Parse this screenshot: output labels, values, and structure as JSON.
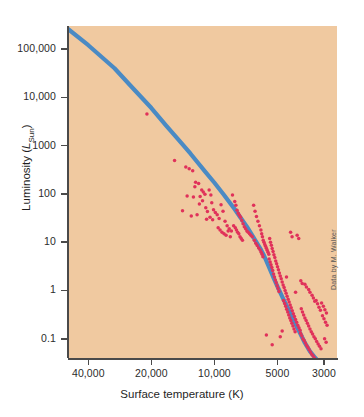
{
  "figure": {
    "credit": "Data by M. Walker",
    "background_color": "#f0c9a0",
    "page_color": "#ffffff"
  },
  "chart_data": {
    "type": "scatter",
    "title": "",
    "xlabel": "Surface temperature (K)",
    "ylabel": "Luminosity (LSun)",
    "ylabel_parts": {
      "main": "Luminosity (",
      "italic": "L",
      "subscript": "Sun",
      "close": ")"
    },
    "xscale": "log",
    "yscale": "log",
    "x_reversed": true,
    "xlim": [
      50000,
      2600
    ],
    "ylim": [
      0.04,
      300000
    ],
    "grid": false,
    "legend": null,
    "xticks": [
      40000,
      20000,
      10000,
      5000,
      3000
    ],
    "xtick_labels": [
      "40,000",
      "20,000",
      "10,000",
      "5000",
      "3000"
    ],
    "yticks": [
      100000,
      10000,
      1000,
      100,
      10,
      1,
      0.1
    ],
    "ytick_labels": [
      "100,000",
      "10,000",
      "1000",
      "100",
      "10",
      "1",
      "0.1"
    ],
    "point_color": "#e0315a",
    "line_color": "#4a8ac4",
    "line_width": 4.2,
    "series": [
      {
        "name": "main sequence",
        "type": "line",
        "points": [
          [
            50000,
            260000
          ],
          [
            40000,
            120000
          ],
          [
            30000,
            40000
          ],
          [
            25000,
            17000
          ],
          [
            20000,
            6000
          ],
          [
            17000,
            2600
          ],
          [
            15000,
            1400
          ],
          [
            13000,
            680
          ],
          [
            11000,
            280
          ],
          [
            10000,
            170
          ],
          [
            9000,
            95
          ],
          [
            8000,
            48
          ],
          [
            7500,
            32
          ],
          [
            7000,
            21
          ],
          [
            6500,
            12.5
          ],
          [
            6000,
            7.0
          ],
          [
            5800,
            5.3
          ],
          [
            5500,
            3.1
          ],
          [
            5200,
            1.75
          ],
          [
            5000,
            1.2
          ],
          [
            4700,
            0.68
          ],
          [
            4400,
            0.38
          ],
          [
            4100,
            0.2
          ],
          [
            3900,
            0.13
          ],
          [
            3700,
            0.082
          ],
          [
            3500,
            0.055
          ],
          [
            3300,
            0.04
          ],
          [
            3150,
            0.032
          ]
        ]
      },
      {
        "name": "stars",
        "type": "scatter",
        "points": [
          [
            21000,
            4500
          ],
          [
            15500,
            490
          ],
          [
            13700,
            360
          ],
          [
            13200,
            330
          ],
          [
            12700,
            300
          ],
          [
            12300,
            175
          ],
          [
            11900,
            165
          ],
          [
            11500,
            120
          ],
          [
            11300,
            110
          ],
          [
            11100,
            98
          ],
          [
            12600,
            86
          ],
          [
            11800,
            62
          ],
          [
            11400,
            72
          ],
          [
            11000,
            52
          ],
          [
            10800,
            43
          ],
          [
            12100,
            37
          ],
          [
            12900,
            35
          ],
          [
            10600,
            120
          ],
          [
            10400,
            95
          ],
          [
            10300,
            66
          ],
          [
            10100,
            47
          ],
          [
            10500,
            33
          ],
          [
            10900,
            30
          ],
          [
            10200,
            29
          ],
          [
            9900,
            41
          ],
          [
            9700,
            37
          ],
          [
            9500,
            31
          ],
          [
            9300,
            60
          ],
          [
            9100,
            44
          ],
          [
            8900,
            27
          ],
          [
            8700,
            22
          ],
          [
            8500,
            19
          ],
          [
            8300,
            17
          ],
          [
            9600,
            20
          ],
          [
            9400,
            18
          ],
          [
            9200,
            16
          ],
          [
            9000,
            15
          ],
          [
            8800,
            14
          ],
          [
            8600,
            17
          ],
          [
            8400,
            13
          ],
          [
            8200,
            95
          ],
          [
            8000,
            70
          ],
          [
            7900,
            58
          ],
          [
            7800,
            46
          ],
          [
            7700,
            40
          ],
          [
            7600,
            36
          ],
          [
            7500,
            33
          ],
          [
            7400,
            28
          ],
          [
            7300,
            24
          ],
          [
            7200,
            21
          ],
          [
            7100,
            19
          ],
          [
            7000,
            17
          ],
          [
            6900,
            16
          ],
          [
            6800,
            15
          ],
          [
            6700,
            14
          ],
          [
            6600,
            13
          ],
          [
            8100,
            22
          ],
          [
            7950,
            20
          ],
          [
            7850,
            18
          ],
          [
            7750,
            16
          ],
          [
            7650,
            15
          ],
          [
            7550,
            13
          ],
          [
            7450,
            12
          ],
          [
            7350,
            11
          ],
          [
            6500,
            58
          ],
          [
            6400,
            44
          ],
          [
            6300,
            34
          ],
          [
            6200,
            27
          ],
          [
            6100,
            22
          ],
          [
            6000,
            18
          ],
          [
            5950,
            15
          ],
          [
            5900,
            13
          ],
          [
            5850,
            11
          ],
          [
            5800,
            10
          ],
          [
            5750,
            9.0
          ],
          [
            5700,
            8.2
          ],
          [
            5650,
            7.5
          ],
          [
            5600,
            6.8
          ],
          [
            5550,
            6.2
          ],
          [
            5500,
            5.6
          ],
          [
            6450,
            11
          ],
          [
            6350,
            9.5
          ],
          [
            6250,
            8.5
          ],
          [
            6150,
            7.6
          ],
          [
            6050,
            6.9
          ],
          [
            5980,
            6.2
          ],
          [
            5920,
            5.6
          ],
          [
            5870,
            5.0
          ],
          [
            5450,
            12
          ],
          [
            5400,
            10
          ],
          [
            5350,
            8.6
          ],
          [
            5300,
            7.4
          ],
          [
            5250,
            6.4
          ],
          [
            5200,
            5.5
          ],
          [
            5150,
            4.8
          ],
          [
            5100,
            4.1
          ],
          [
            5050,
            3.6
          ],
          [
            5000,
            3.1
          ],
          [
            4950,
            2.7
          ],
          [
            4900,
            2.3
          ],
          [
            4850,
            2.0
          ],
          [
            4800,
            1.75
          ],
          [
            4750,
            1.5
          ],
          [
            4700,
            1.3
          ],
          [
            5480,
            4.5
          ],
          [
            5420,
            3.9
          ],
          [
            5370,
            3.4
          ],
          [
            5320,
            3.0
          ],
          [
            5270,
            2.6
          ],
          [
            5220,
            2.2
          ],
          [
            5170,
            1.9
          ],
          [
            5120,
            1.65
          ],
          [
            5070,
            1.45
          ],
          [
            5020,
            1.25
          ],
          [
            4970,
            1.1
          ],
          [
            4920,
            0.95
          ],
          [
            4650,
            1.15
          ],
          [
            4600,
            1.0
          ],
          [
            4550,
            0.88
          ],
          [
            4500,
            0.76
          ],
          [
            4450,
            0.66
          ],
          [
            4400,
            0.58
          ],
          [
            4350,
            0.5
          ],
          [
            4300,
            0.44
          ],
          [
            4250,
            0.38
          ],
          [
            4200,
            0.33
          ],
          [
            4150,
            0.29
          ],
          [
            4100,
            0.25
          ],
          [
            4050,
            0.22
          ],
          [
            4000,
            0.19
          ],
          [
            3950,
            0.17
          ],
          [
            3900,
            0.15
          ],
          [
            4680,
            0.62
          ],
          [
            4620,
            0.54
          ],
          [
            4570,
            0.47
          ],
          [
            4520,
            0.41
          ],
          [
            4470,
            0.36
          ],
          [
            4420,
            0.31
          ],
          [
            4370,
            0.27
          ],
          [
            4320,
            0.24
          ],
          [
            4270,
            0.21
          ],
          [
            4220,
            0.185
          ],
          [
            4170,
            0.16
          ],
          [
            4120,
            0.14
          ],
          [
            3850,
            0.42
          ],
          [
            3800,
            0.36
          ],
          [
            3750,
            0.31
          ],
          [
            3700,
            0.27
          ],
          [
            3650,
            0.24
          ],
          [
            3600,
            0.21
          ],
          [
            3550,
            0.185
          ],
          [
            3500,
            0.16
          ],
          [
            3450,
            0.14
          ],
          [
            3400,
            0.125
          ],
          [
            3350,
            0.11
          ],
          [
            3300,
            0.1
          ],
          [
            3250,
            0.088
          ],
          [
            3200,
            0.078
          ],
          [
            3150,
            0.07
          ],
          [
            3100,
            0.062
          ],
          [
            3880,
            0.13
          ],
          [
            3830,
            0.115
          ],
          [
            3780,
            0.1
          ],
          [
            3730,
            0.092
          ],
          [
            3680,
            0.082
          ],
          [
            3630,
            0.073
          ],
          [
            3580,
            0.066
          ],
          [
            3530,
            0.059
          ],
          [
            3480,
            0.053
          ],
          [
            3430,
            0.048
          ],
          [
            3380,
            0.044
          ],
          [
            3330,
            0.04
          ],
          [
            3050,
            0.3
          ],
          [
            3000,
            0.26
          ],
          [
            2950,
            0.22
          ],
          [
            2900,
            0.19
          ],
          [
            3080,
            0.55
          ],
          [
            3020,
            0.47
          ],
          [
            2970,
            0.4
          ],
          [
            2920,
            0.34
          ],
          [
            3270,
            0.62
          ],
          [
            3220,
            0.53
          ],
          [
            3170,
            0.45
          ],
          [
            3120,
            0.39
          ],
          [
            3420,
            0.8
          ],
          [
            3370,
            0.7
          ],
          [
            3320,
            0.6
          ],
          [
            3550,
            1.05
          ],
          [
            3500,
            0.92
          ],
          [
            3700,
            1.35
          ],
          [
            3640,
            1.18
          ],
          [
            3870,
            1.6
          ],
          [
            3810,
            1.4
          ],
          [
            4030,
            14
          ],
          [
            3960,
            12
          ],
          [
            4330,
            16
          ],
          [
            4260,
            13
          ],
          [
            4530,
            1.9
          ],
          [
            4100,
            0.92
          ],
          [
            5650,
            0.12
          ],
          [
            4750,
            0.145
          ],
          [
            5300,
            0.075
          ],
          [
            4850,
            0.11
          ],
          [
            3600,
            0.035
          ],
          [
            3520,
            0.031
          ],
          [
            3260,
            0.028
          ],
          [
            3180,
            0.025
          ],
          [
            2980,
            0.1
          ],
          [
            2930,
            0.085
          ],
          [
            13500,
            90
          ],
          [
            12400,
            140
          ],
          [
            14200,
            45
          ],
          [
            11700,
            88
          ]
        ]
      }
    ]
  }
}
